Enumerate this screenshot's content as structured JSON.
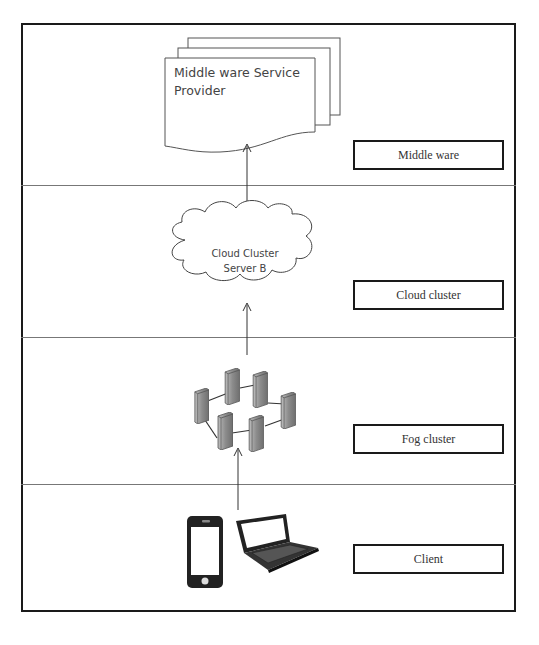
{
  "diagram": {
    "layers": [
      {
        "name": "middleware",
        "label": "Middle ware"
      },
      {
        "name": "cloud-cluster",
        "label": "Cloud cluster"
      },
      {
        "name": "fog-cluster",
        "label": "Fog cluster"
      },
      {
        "name": "client",
        "label": "Client"
      }
    ],
    "middleware_node": {
      "line1": "Middle ware Service",
      "line2": "Provider"
    },
    "cloud_node": {
      "line1": "Cloud  Cluster",
      "line2": "Server B"
    },
    "fog_node": {
      "icon": "server-cluster-icon",
      "server_count": 6
    },
    "client_nodes": [
      {
        "icon": "smartphone-icon"
      },
      {
        "icon": "laptop-icon"
      }
    ],
    "colors": {
      "line": "#1a1a1a",
      "text": "#444444",
      "server_fill": "#8a8a8a"
    }
  }
}
